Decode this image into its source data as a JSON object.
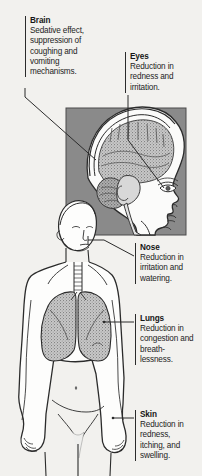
{
  "figure": {
    "kind": "medical-illustration",
    "background_color": "#f2f1ee",
    "inset_panel_color": "#8a8a8a",
    "organ_fill_color": "#9a9a9a",
    "outline_color": "#2b2b2b"
  },
  "callouts": [
    {
      "id": "brain",
      "title": "Brain",
      "body": "Sedative effect, suppression of coughing and vomiting mechanisms."
    },
    {
      "id": "eyes",
      "title": "Eyes",
      "body": "Reduction in redness and irritation."
    },
    {
      "id": "nose",
      "title": "Nose",
      "body": "Reduction in irritation and watering."
    },
    {
      "id": "lungs",
      "title": "Lungs",
      "body": "Reduction in congestion and breath-lessness."
    },
    {
      "id": "skin",
      "title": "Skin",
      "body": "Reduction in redness, itching, and swelling."
    }
  ]
}
